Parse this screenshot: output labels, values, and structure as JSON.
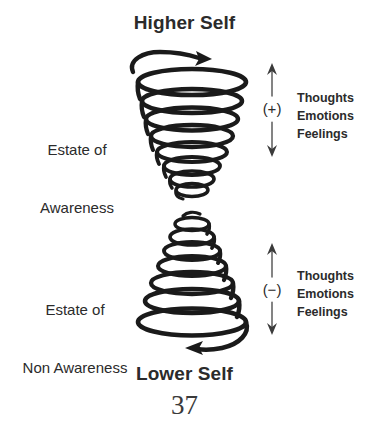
{
  "page": {
    "background_color": "#ffffff",
    "ink_color": "#1a1a1a",
    "width": 369,
    "height": 434,
    "page_number": "37"
  },
  "diagram": {
    "type": "double-spiral-hourglass",
    "title_top": "Higher Self",
    "title_bottom": "Lower Self",
    "upper_spiral": {
      "name": "awareness-spiral",
      "shape": "cone-widest-at-top",
      "rotation_arrow": "clockwise-arrowhead-pointing-right-at-top"
    },
    "lower_spiral": {
      "name": "non-awareness-spiral",
      "shape": "cone-widest-at-bottom",
      "rotation_arrow": "counterclockwise-arrowhead-pointing-left-at-bottom"
    }
  },
  "left_labels": [
    {
      "id": "awareness",
      "line1": "Estate of",
      "line2": "Awareness"
    },
    {
      "id": "non_awareness",
      "line1": "Estate of",
      "line2": "Non Awareness"
    }
  ],
  "right_annotations": [
    {
      "id": "positive",
      "sign": "(+)",
      "arrow": "double-headed-vertical",
      "items": [
        "Thoughts",
        "Emotions",
        "Feelings"
      ],
      "items_text": "Thoughts\nEmotions\nFeelings"
    },
    {
      "id": "negative",
      "sign": "(−)",
      "arrow": "double-headed-vertical",
      "items": [
        "Thoughts",
        "Emotions",
        "Feelings"
      ],
      "items_text": "Thoughts\nEmotions\nFeelings"
    }
  ]
}
